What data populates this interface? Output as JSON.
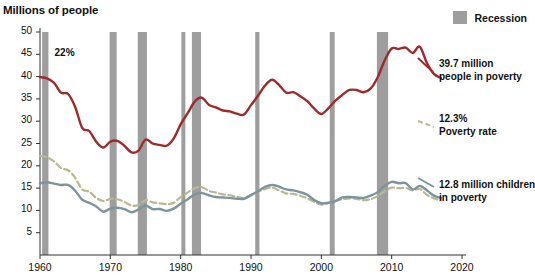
{
  "chart_data": {
    "type": "line",
    "title": "",
    "ylabel": "Millions of people",
    "xlabel": "",
    "xlim": [
      1960,
      2020
    ],
    "ylim": [
      0,
      50
    ],
    "ytick_labels": [
      "5",
      "10",
      "15",
      "20",
      "25",
      "30",
      "35",
      "40",
      "45",
      "50"
    ],
    "ytick_values": [
      5,
      10,
      15,
      20,
      25,
      30,
      35,
      40,
      45,
      50
    ],
    "xtick_labels": [
      "1960",
      "1970",
      "1980",
      "1990",
      "2000",
      "2010",
      "2020"
    ],
    "xtick_values": [
      1960,
      1970,
      1980,
      1990,
      2000,
      2010,
      2020
    ],
    "grid": false,
    "legend_position": "top-right",
    "legend": [
      {
        "label": "Recession",
        "color": "#9e9e9e",
        "style": "band"
      }
    ],
    "series": [
      {
        "name": "People in poverty (millions)",
        "color": "#9e2b2b",
        "style": "solid",
        "end_label": "39.7 million people in poverty",
        "x": [
          1960,
          1961,
          1962,
          1963,
          1964,
          1965,
          1966,
          1967,
          1968,
          1969,
          1970,
          1971,
          1972,
          1973,
          1974,
          1975,
          1976,
          1977,
          1978,
          1979,
          1980,
          1981,
          1982,
          1983,
          1984,
          1985,
          1986,
          1987,
          1988,
          1989,
          1990,
          1991,
          1992,
          1993,
          1994,
          1995,
          1996,
          1997,
          1998,
          1999,
          2000,
          2001,
          2002,
          2003,
          2004,
          2005,
          2006,
          2007,
          2008,
          2009,
          2010,
          2011,
          2012,
          2013,
          2014,
          2015,
          2016,
          2017
        ],
        "values": [
          39.9,
          39.6,
          38.6,
          36.4,
          36.1,
          33.2,
          28.5,
          27.8,
          25.4,
          24.1,
          25.4,
          25.6,
          24.5,
          23.0,
          23.4,
          25.9,
          25.0,
          24.7,
          24.5,
          26.1,
          29.3,
          31.8,
          34.4,
          35.3,
          33.7,
          33.1,
          32.4,
          32.2,
          31.7,
          31.5,
          33.6,
          35.7,
          38.0,
          39.3,
          38.1,
          36.4,
          36.5,
          35.6,
          34.5,
          32.8,
          31.6,
          32.9,
          34.6,
          35.9,
          37.0,
          37.0,
          36.5,
          37.3,
          39.8,
          43.6,
          46.3,
          46.2,
          46.5,
          45.3,
          46.7,
          43.1,
          40.6,
          39.7
        ]
      },
      {
        "name": "Poverty rate (percent)",
        "color": "#b9b892",
        "style": "dashed",
        "start_label": "22%",
        "end_label": "12.3% Poverty rate",
        "x": [
          1960,
          1961,
          1962,
          1963,
          1964,
          1965,
          1966,
          1967,
          1968,
          1969,
          1970,
          1971,
          1972,
          1973,
          1974,
          1975,
          1976,
          1977,
          1978,
          1979,
          1980,
          1981,
          1982,
          1983,
          1984,
          1985,
          1986,
          1987,
          1988,
          1989,
          1990,
          1991,
          1992,
          1993,
          1994,
          1995,
          1996,
          1997,
          1998,
          1999,
          2000,
          2001,
          2002,
          2003,
          2004,
          2005,
          2006,
          2007,
          2008,
          2009,
          2010,
          2011,
          2012,
          2013,
          2014,
          2015,
          2016,
          2017
        ],
        "values": [
          22.2,
          21.9,
          21.0,
          19.5,
          19.0,
          17.3,
          14.7,
          14.2,
          12.8,
          12.1,
          12.6,
          12.5,
          11.9,
          11.1,
          11.2,
          12.3,
          11.8,
          11.6,
          11.4,
          11.7,
          13.0,
          14.0,
          15.0,
          15.2,
          14.4,
          14.0,
          13.6,
          13.4,
          13.0,
          12.8,
          13.5,
          14.2,
          14.8,
          15.1,
          14.5,
          13.8,
          13.7,
          13.3,
          12.7,
          11.9,
          11.3,
          11.7,
          12.1,
          12.5,
          12.7,
          12.6,
          12.3,
          12.5,
          13.2,
          14.3,
          15.1,
          15.0,
          15.0,
          14.5,
          14.8,
          13.5,
          12.7,
          12.3
        ]
      },
      {
        "name": "Children in poverty (millions)",
        "color": "#7d949c",
        "style": "solid",
        "end_label": "12.8 million children in poverty",
        "x": [
          1960,
          1961,
          1962,
          1963,
          1964,
          1965,
          1966,
          1967,
          1968,
          1969,
          1970,
          1971,
          1972,
          1973,
          1974,
          1975,
          1976,
          1977,
          1978,
          1979,
          1980,
          1981,
          1982,
          1983,
          1984,
          1985,
          1986,
          1987,
          1988,
          1989,
          1990,
          1991,
          1992,
          1993,
          1994,
          1995,
          1996,
          1997,
          1998,
          1999,
          2000,
          2001,
          2002,
          2003,
          2004,
          2005,
          2006,
          2007,
          2008,
          2009,
          2010,
          2011,
          2012,
          2013,
          2014,
          2015,
          2016,
          2017
        ],
        "values": [
          16.1,
          16.3,
          16.0,
          15.7,
          15.7,
          14.4,
          12.4,
          11.7,
          10.9,
          9.7,
          10.4,
          10.6,
          10.3,
          9.6,
          10.2,
          11.1,
          10.3,
          10.3,
          9.9,
          10.4,
          11.5,
          12.5,
          13.6,
          13.9,
          13.4,
          13.0,
          12.9,
          12.8,
          12.6,
          12.6,
          13.4,
          14.3,
          15.3,
          15.7,
          15.3,
          14.7,
          14.5,
          14.1,
          13.5,
          12.3,
          11.6,
          11.7,
          12.1,
          12.9,
          13.0,
          12.9,
          12.8,
          13.3,
          14.1,
          15.5,
          16.4,
          16.1,
          16.1,
          14.7,
          15.5,
          14.5,
          13.3,
          12.8
        ]
      }
    ],
    "recession_bands": [
      {
        "start": 1960.3,
        "end": 1961.2
      },
      {
        "start": 1969.9,
        "end": 1970.9
      },
      {
        "start": 1973.9,
        "end": 1975.2
      },
      {
        "start": 1980.1,
        "end": 1980.6
      },
      {
        "start": 1981.6,
        "end": 1982.9
      },
      {
        "start": 1990.6,
        "end": 1991.2
      },
      {
        "start": 2001.2,
        "end": 2001.9
      },
      {
        "start": 2007.9,
        "end": 2009.5
      }
    ],
    "band_color": "#9e9e9e",
    "annotations": [
      {
        "text": "22%",
        "x": 1961.5,
        "y": 45.0
      }
    ]
  },
  "callouts": {
    "people_line1": "39.7 million",
    "people_line2": "people in poverty",
    "rate_line1": "12.3%",
    "rate_line2": "Poverty rate",
    "children_line1": "12.8 million children",
    "children_line2": "in poverty"
  },
  "legend": {
    "recession_label": "Recession"
  },
  "axis": {
    "y_title": "Millions of people"
  }
}
